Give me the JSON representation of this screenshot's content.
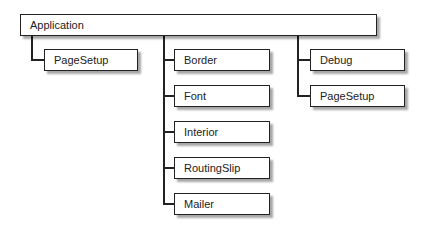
{
  "root": {
    "label": "Application"
  },
  "columns": [
    {
      "items": [
        {
          "label": "PageSetup"
        }
      ]
    },
    {
      "items": [
        {
          "label": "Border"
        },
        {
          "label": "Font"
        },
        {
          "label": "Interior"
        },
        {
          "label": "RoutingSlip"
        },
        {
          "label": "Mailer"
        }
      ]
    },
    {
      "items": [
        {
          "label": "Debug"
        },
        {
          "label": "PageSetup"
        }
      ]
    }
  ]
}
